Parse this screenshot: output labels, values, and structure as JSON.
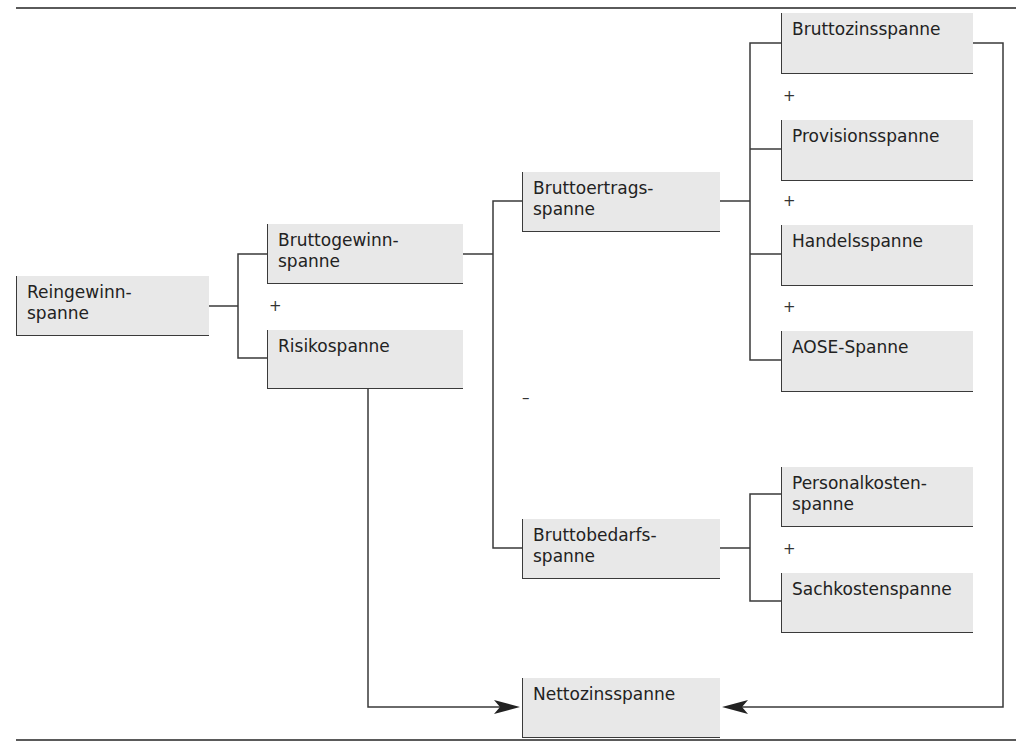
{
  "diagram": {
    "type": "tree",
    "title": "",
    "nodes": {
      "reingewinnspanne": "Reingewinn-\nspanne",
      "bruttogewinnspanne": "Bruttogewinn-\nspanne",
      "risikospanne": "Risikospanne",
      "bruttoertragsspanne": "Bruttoertrags-\nspanne",
      "bruttobedarfsspanne": "Bruttobedarfs-\nspanne",
      "bruttozinsspanne": "Bruttozinsspanne",
      "provisionsspanne": "Provisionsspanne",
      "handelsspanne": "Handelsspanne",
      "aose_spanne": "AOSE-Spanne",
      "personalkostenspanne": "Personalkosten-\nspanne",
      "sachkostenspanne": "Sachkostenspanne",
      "nettozinsspanne": "Nettozinsspanne"
    },
    "operators": {
      "plus_gewinn_risiko": "+",
      "minus_ertrag_bedarf": "–",
      "plus_zins_provision": "+",
      "plus_provision_handel": "+",
      "plus_handel_aose": "+",
      "plus_personal_sach": "+"
    },
    "edges": [
      {
        "from": "reingewinnspanne",
        "to": "bruttogewinnspanne",
        "op": "+"
      },
      {
        "from": "reingewinnspanne",
        "to": "risikospanne",
        "op": "+"
      },
      {
        "from": "bruttogewinnspanne",
        "to": "bruttoertragsspanne",
        "op": "+"
      },
      {
        "from": "bruttogewinnspanne",
        "to": "bruttobedarfsspanne",
        "op": "–"
      },
      {
        "from": "bruttoertragsspanne",
        "to": "bruttozinsspanne",
        "op": "+"
      },
      {
        "from": "bruttoertragsspanne",
        "to": "provisionsspanne",
        "op": "+"
      },
      {
        "from": "bruttoertragsspanne",
        "to": "handelsspanne",
        "op": "+"
      },
      {
        "from": "bruttoertragsspanne",
        "to": "aose_spanne",
        "op": "+"
      },
      {
        "from": "bruttobedarfsspanne",
        "to": "personalkostenspanne",
        "op": "+"
      },
      {
        "from": "bruttobedarfsspanne",
        "to": "sachkostenspanne",
        "op": "+"
      },
      {
        "from": "risikospanne",
        "to": "nettozinsspanne",
        "arrow": true
      },
      {
        "from": "bruttozinsspanne",
        "to": "nettozinsspanne",
        "arrow": true
      }
    ],
    "colors": {
      "box_fill": "#e8e8e8",
      "line": "#3a3a3a",
      "rule": "#5a5a5a"
    }
  }
}
